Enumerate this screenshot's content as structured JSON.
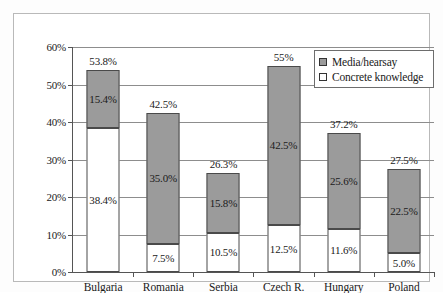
{
  "chart_data": {
    "type": "bar",
    "title": "",
    "subtitle": "",
    "xlabel": "",
    "ylabel": "",
    "stacked": true,
    "grid": true,
    "legend_position": "top-right",
    "ylim": [
      0,
      60
    ],
    "ytick_labels": [
      "0%",
      "10%",
      "20%",
      "30%",
      "40%",
      "50%",
      "60%"
    ],
    "ytick_values": [
      0,
      10,
      20,
      30,
      40,
      50,
      60
    ],
    "categories": [
      "Bulgaria",
      "Romania",
      "Serbia",
      "Czech R.",
      "Hungary",
      "Poland"
    ],
    "series": [
      {
        "name": "Concrete knowledge",
        "color": "#ffffff",
        "values": [
          38.4,
          7.5,
          10.5,
          12.5,
          11.6,
          5.0
        ],
        "labels": [
          "38.4%",
          "7.5%",
          "10.5%",
          "12.5%",
          "11.6%",
          "5.0%"
        ]
      },
      {
        "name": "Media/hearsay",
        "color": "#9b9b9b",
        "values": [
          15.4,
          35.0,
          15.8,
          42.5,
          25.6,
          22.5
        ],
        "labels": [
          "15.4%",
          "35.0%",
          "15.8%",
          "42.5%",
          "25.6%",
          "22.5%"
        ]
      }
    ],
    "totals": [
      53.8,
      42.5,
      26.3,
      55.0,
      37.2,
      27.5
    ],
    "total_labels": [
      "53.8%",
      "42.5%",
      "26.3%",
      "55%",
      "37.2%",
      "27.5%"
    ]
  },
  "legend": {
    "items": [
      {
        "label": "Media/hearsay",
        "swatch": "media"
      },
      {
        "label": "Concrete knowledge",
        "swatch": "concrete"
      }
    ]
  },
  "colors": {
    "media": "#9b9b9b",
    "concrete": "#ffffff",
    "grid": "#8d8d8d",
    "axis": "#555555",
    "frame": "#b9b9b9"
  }
}
